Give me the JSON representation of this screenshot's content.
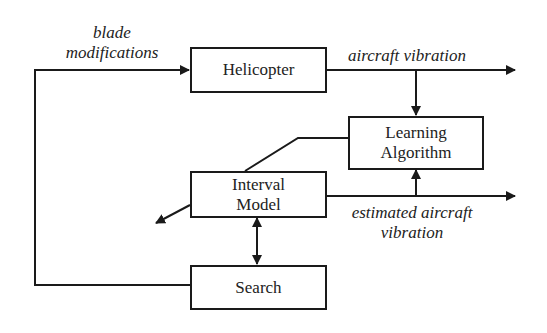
{
  "diagram": {
    "type": "block-flow",
    "nodes": {
      "helicopter": {
        "label": "Helicopter"
      },
      "learning": {
        "label_line1": "Learning",
        "label_line2": "Algorithm"
      },
      "interval": {
        "label_line1": "Interval",
        "label_line2": "Model"
      },
      "search": {
        "label": "Search"
      }
    },
    "edge_labels": {
      "blade_line1": "blade",
      "blade_line2": "modifications",
      "aircraft_vibration": "aircraft vibration",
      "estimated_line1": "estimated aircraft",
      "estimated_line2": "vibration"
    },
    "edges": [
      {
        "from": "search",
        "to": "helicopter",
        "label": "blade modifications"
      },
      {
        "from": "helicopter",
        "to": "output",
        "label": "aircraft vibration"
      },
      {
        "from": "helicopter-output",
        "to": "learning"
      },
      {
        "from": "learning",
        "to": "interval",
        "style": "line"
      },
      {
        "from": "interval",
        "to": "output",
        "label": "estimated aircraft vibration"
      },
      {
        "from": "interval-output",
        "to": "learning"
      },
      {
        "from": "interval",
        "to": "search",
        "style": "bidirectional"
      },
      {
        "from": "interval",
        "to": "lower-left",
        "style": "arrow"
      }
    ],
    "colors": {
      "stroke": "#1a1a1a",
      "background": "#ffffff",
      "text": "#222222"
    }
  }
}
